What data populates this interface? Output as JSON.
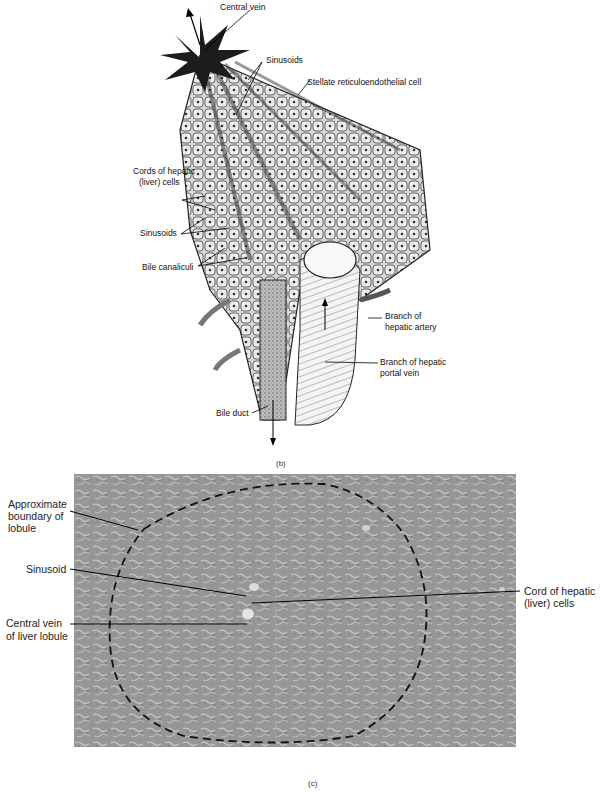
{
  "figure_b": {
    "caption": "(b)",
    "labels": {
      "central_vein": "Central vein",
      "sinusoids_top": "Sinusoids",
      "stellate": "Stellate  reticuloendothelial cell",
      "cords_line1": "Cords of hepatic",
      "cords_line2": "(liver) cells",
      "sinusoids_left": "Sinusoids",
      "bile_canaliculi": "Bile canaliculi",
      "hepatic_artery_line1": "Branch of",
      "hepatic_artery_line2": "hepatic artery",
      "portal_vein_line1": "Branch of hepatic",
      "portal_vein_line2": "portal vein",
      "bile_duct": "Bile duct"
    }
  },
  "figure_c": {
    "caption": "(c)",
    "labels": {
      "boundary_line1": "Approximate",
      "boundary_line2": "boundary of",
      "boundary_line3": "lobule",
      "sinusoid": "Sinusoid",
      "central_vein_line1": "Central vein",
      "central_vein_line2": "of liver lobule",
      "cord_line1": "Cord of hepatic",
      "cord_line2": "(liver) cells"
    }
  }
}
